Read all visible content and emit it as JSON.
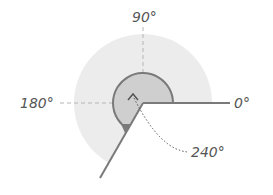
{
  "diagram": {
    "labels": {
      "deg0": "0°",
      "deg90": "90°",
      "deg180": "180°",
      "deg240": "240°"
    },
    "angle_value_deg": 240,
    "colors": {
      "outer_sector": "#ececec",
      "inner_sector": "#cfcfcf",
      "stroke": "#7a7a7a",
      "axis": "#b5b5b5",
      "text": "#555555"
    }
  }
}
